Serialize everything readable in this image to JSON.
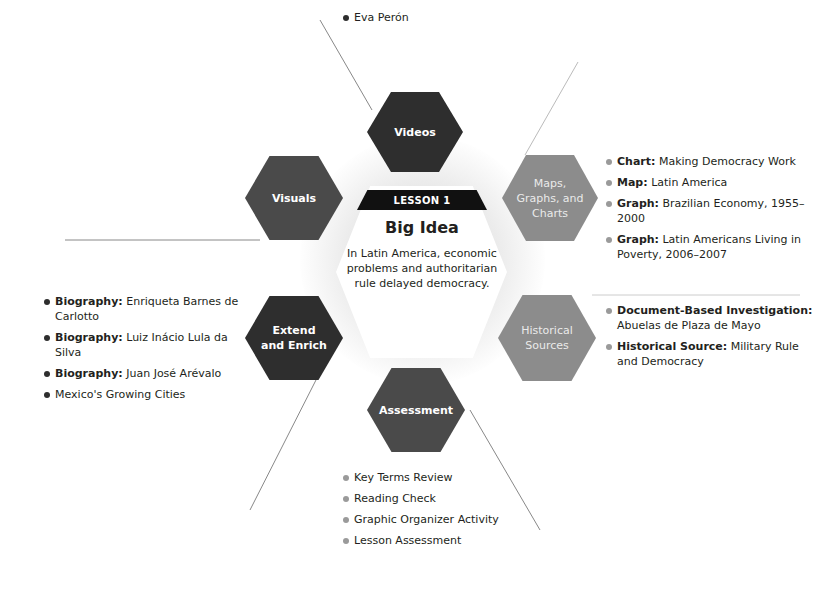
{
  "center": {
    "lesson_label": "LESSON 1",
    "title": "Big Idea",
    "text": "In Latin America, economic problems and authoritarian rule delayed democracy."
  },
  "hexes": {
    "videos": {
      "label": "Videos",
      "color": "#2e2e2e"
    },
    "visuals": {
      "label": "Visuals",
      "color": "#4a4a4a"
    },
    "maps": {
      "label_lines": [
        "Maps,",
        "Graphs, and",
        "Charts"
      ],
      "color": "#8c8c8c"
    },
    "historical": {
      "label_lines": [
        "Historical",
        "Sources"
      ],
      "color": "#8c8c8c"
    },
    "extend": {
      "label_lines": [
        "Extend",
        "and Enrich"
      ],
      "color": "#2e2e2e"
    },
    "assessment": {
      "label": "Assessment",
      "color": "#4a4a4a"
    }
  },
  "lists": {
    "videos": [
      {
        "bold": "",
        "text": "Eva Perón"
      }
    ],
    "maps": [
      {
        "bold": "Chart:",
        "text": " Making Democracy Work"
      },
      {
        "bold": "Map:",
        "text": " Latin America"
      },
      {
        "bold": "Graph:",
        "text": " Brazilian Economy, 1955–2000"
      },
      {
        "bold": "Graph:",
        "text": " Latin Americans Living in Poverty, 2006–2007"
      }
    ],
    "historical": [
      {
        "bold": "Document-Based Investigation:",
        "text": " Abuelas de Plaza de Mayo"
      },
      {
        "bold": "Historical Source:",
        "text": " Military Rule and Democracy"
      }
    ],
    "extend": [
      {
        "bold": "Biography:",
        "text": " Enriqueta Barnes de Carlotto"
      },
      {
        "bold": "Biography:",
        "text": " Luiz Inácio Lula da Silva"
      },
      {
        "bold": "Biography:",
        "text": " Juan José Arévalo"
      },
      {
        "bold": "",
        "text": "Mexico's Growing Cities"
      }
    ],
    "assessment": [
      {
        "bold": "",
        "text": "Key Terms Review"
      },
      {
        "bold": "",
        "text": "Reading Check"
      },
      {
        "bold": "",
        "text": "Graphic Organizer Activity"
      },
      {
        "bold": "",
        "text": "Lesson Assessment"
      }
    ]
  }
}
